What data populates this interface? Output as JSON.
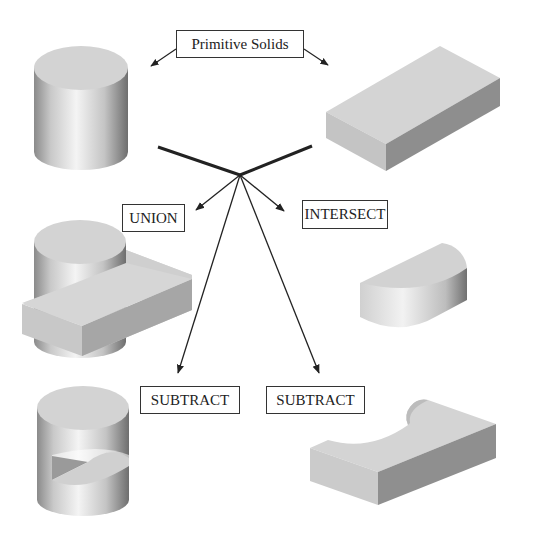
{
  "title_label": "Primitive Solids",
  "operations": {
    "union": "UNION",
    "intersect": "INTERSECT",
    "subtract_left": "SUBTRACT",
    "subtract_right": "SUBTRACT"
  },
  "solids": {
    "primitive_1": "cylinder",
    "primitive_2": "rectangular-block",
    "union_result": "cylinder-union-block",
    "intersect_result": "half-cylinder",
    "subtract_left_result": "cylinder-minus-block",
    "subtract_right_result": "block-minus-cylinder"
  },
  "colors": {
    "line": "#222222",
    "face_top": "#d2d2d2",
    "face_side_light": "#c8c8c8",
    "face_side_dark": "#8c8c8c"
  }
}
